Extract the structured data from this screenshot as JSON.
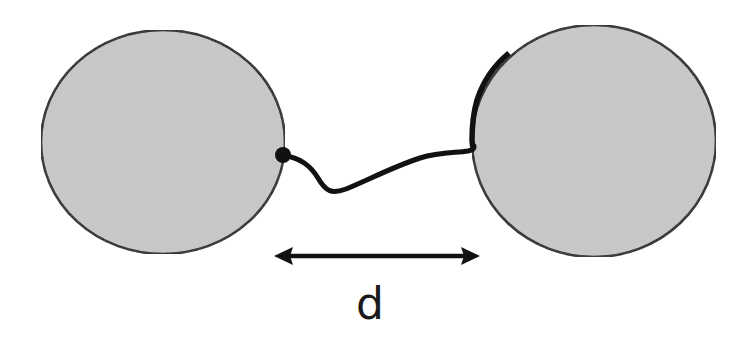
{
  "diagram": {
    "label": "d",
    "colors": {
      "sphere_fill": "#c9c9c9",
      "stroke": "#111111",
      "background": "#ffffff"
    },
    "elements": {
      "left_sphere": {
        "cx": 163,
        "cy": 142,
        "rx": 122,
        "ry": 112
      },
      "right_sphere": {
        "cx": 594,
        "cy": 141,
        "rx": 122,
        "ry": 116
      },
      "anchor_point": {
        "cx": 283,
        "cy": 155,
        "r": 8
      },
      "distance_arrow": {
        "x1": 274,
        "x2": 480,
        "y": 256
      }
    }
  }
}
